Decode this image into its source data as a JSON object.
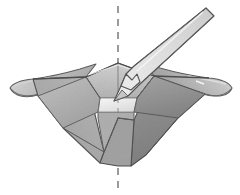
{
  "figure": {
    "title": "Inverted pyramidal funnel with barbed probe",
    "background_color": "#ffffff",
    "width": 240,
    "height": 195,
    "style": "grayscale halftone scanned line illustration"
  },
  "palette": {
    "paper": "#ffffff",
    "outline": "#4a4a4a",
    "outline_soft": "#6f6f6f",
    "wall_left_light": "#bcbcbc",
    "wall_left_mid": "#ababab",
    "wall_far_light": "#c9c9c9",
    "wall_right_dark": "#9a9a9a",
    "wall_right_darker": "#8d8d8d",
    "floor_light": "#ededed",
    "rim_top_light": "#d8d8d8",
    "flange_light": "#cfcfcf",
    "flange_shadow": "#a9a9a9",
    "probe_body": "#e8e8e8",
    "probe_shade": "#c2c2c2",
    "probe_outline": "#555555",
    "axis_line": "#7a7a7a",
    "speckle": "#9c9c9c"
  },
  "parts": {
    "axis": {
      "name": "symmetry axis",
      "orientation": "vertical",
      "style": "dashed",
      "x": 118,
      "y_top": 6,
      "y_bottom": 188,
      "dash_pattern": "7 6"
    },
    "funnel": {
      "name": "inverted square pyramid funnel",
      "apex_x": 118,
      "apex_y": 166,
      "rim_y": 63,
      "opening_label": "square opening",
      "floor_label": "illuminated floor"
    },
    "flange_left": {
      "name": "left curved flange",
      "tip_x": 10,
      "tip_y": 88
    },
    "flange_right": {
      "name": "right curved flange",
      "tip_x": 232,
      "tip_y": 88
    },
    "probe": {
      "name": "barbed needle probe",
      "entry": "upper right",
      "tip_x": 114,
      "tip_y": 101,
      "tail_x": 206,
      "tail_y": 8,
      "feature": "barb notch near tip"
    }
  },
  "annotations": {
    "labels": [],
    "caption": ""
  }
}
